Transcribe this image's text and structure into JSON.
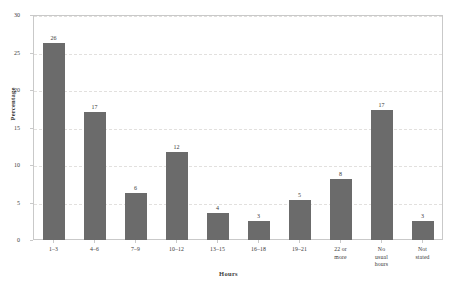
{
  "chart_data": {
    "type": "bar",
    "title": "",
    "xlabel": "Hours",
    "ylabel": "Percentage",
    "categories": [
      "1–3",
      "4–6",
      "7–9",
      "10–12",
      "13–15",
      "16–18",
      "19–21",
      "22 or\nmore",
      "No\nusual\nhours",
      "Not\nstated"
    ],
    "values": [
      26,
      17,
      6,
      12,
      4,
      3,
      5,
      8,
      17,
      3
    ],
    "bar_tops": [
      26.3,
      17.1,
      6.3,
      11.8,
      3.6,
      2.5,
      5.3,
      8.1,
      17.4,
      2.6
    ],
    "data_labels": [
      "26",
      "17",
      "6",
      "12",
      "4",
      "3",
      "5",
      "8",
      "17",
      "3"
    ],
    "ylim": [
      0,
      30
    ],
    "yticks": [
      0,
      5,
      10,
      15,
      20,
      25,
      30
    ],
    "ytick_labels": [
      "0",
      "5",
      "10",
      "15",
      "20",
      "25",
      "30"
    ],
    "grid": true,
    "grid_axis": "y",
    "legend": null,
    "bar_color": "#6b6b6b",
    "grid_color": "#e2e0de",
    "frame_color": "#c9c9c9",
    "background": "#ffffff"
  }
}
